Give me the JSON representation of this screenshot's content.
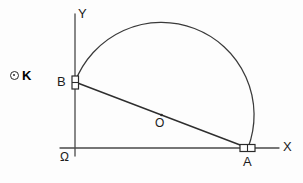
{
  "figure": {
    "background_color": "#fdfdfd",
    "stroke_color": "#3a3a3a",
    "label_color": "#1c1c1c"
  },
  "axes": {
    "x_label": "X",
    "y_label": "Y",
    "origin_label": "Ω",
    "x_axis": {
      "x1": 60,
      "y1": 148,
      "x2": 279,
      "y2": 148
    },
    "y_axis": {
      "x1": 75,
      "y1": 14,
      "x2": 75,
      "y2": 156
    }
  },
  "points": [
    {
      "name": "B",
      "label": "B",
      "x": 75,
      "y": 82,
      "on": "y-axis",
      "marker": "right-angle-rect-vertical"
    },
    {
      "name": "A",
      "label": "A",
      "x": 248,
      "y": 148,
      "on": "x-axis",
      "marker": "right-angle-rect-horizontal"
    },
    {
      "name": "O",
      "label": "O",
      "x": 161.5,
      "y": 115,
      "on": "chord-midpoint",
      "marker": "dot"
    }
  ],
  "chord": {
    "from": "B",
    "to": "A",
    "x1": 75,
    "y1": 82,
    "x2": 248,
    "y2": 148
  },
  "arc": {
    "type": "semicircle",
    "center_x": 161.5,
    "center_y": 115,
    "radius": 92.5,
    "from_point": "B",
    "to_point": "A",
    "bulge": "upper"
  },
  "key": {
    "marker_icon": "circled-dot-icon",
    "label": "K"
  }
}
